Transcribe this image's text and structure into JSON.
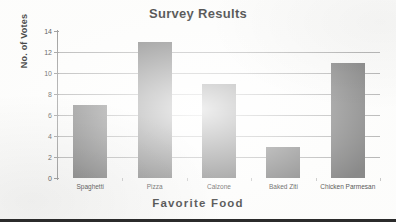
{
  "chart_data": {
    "type": "bar",
    "title": "Survey Results",
    "xlabel": "Favorite Food",
    "ylabel": "No. of Votes",
    "categories": [
      "Spaghetti",
      "Pizza",
      "Calzone",
      "Baked Ziti",
      "Chicken Parmesan"
    ],
    "values": [
      7,
      13,
      9,
      3,
      11
    ],
    "ylim": [
      0,
      14
    ],
    "ytick_step": 2,
    "yticks": [
      0,
      2,
      4,
      6,
      8,
      10,
      12,
      14
    ],
    "ytick_labels": [
      "0",
      "2",
      "4",
      "6",
      "8",
      "10",
      "12",
      "14"
    ],
    "grid": true,
    "legend": false,
    "bar_color": "#6e6e6e",
    "gridline_color": "#a8a8a8",
    "axis_color": "#8c8c8c",
    "text_color": "#1c1c1c"
  }
}
